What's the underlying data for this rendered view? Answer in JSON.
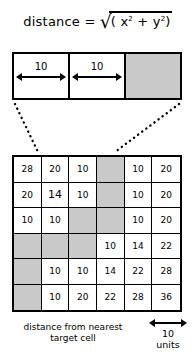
{
  "formula": {
    "label": "distance =",
    "radical_symbol": "√",
    "expression_open": "(",
    "term_x": "x",
    "term_x_exp": "2",
    "operator": "+",
    "term_y": "y",
    "term_y_exp": "2",
    "expression_close": ")",
    "full_text": "distance = √( x² + y² )"
  },
  "top_strip": {
    "cells": [
      {
        "name": "cell-left",
        "fill": "white"
      },
      {
        "name": "cell-middle",
        "fill": "white"
      },
      {
        "name": "cell-target",
        "fill": "gray"
      }
    ],
    "dimensions": [
      {
        "label": "10"
      },
      {
        "label": "10"
      }
    ]
  },
  "grid": {
    "rows": 6,
    "cols": 6,
    "cells": [
      [
        {
          "value": "28",
          "target": false
        },
        {
          "value": "20",
          "target": false
        },
        {
          "value": "10",
          "target": false
        },
        {
          "value": "",
          "target": true
        },
        {
          "value": "10",
          "target": false
        },
        {
          "value": "20",
          "target": false
        }
      ],
      [
        {
          "value": "20",
          "target": false
        },
        {
          "value": "14",
          "target": false
        },
        {
          "value": "10",
          "target": false
        },
        {
          "value": "",
          "target": true
        },
        {
          "value": "10",
          "target": false
        },
        {
          "value": "20",
          "target": false
        }
      ],
      [
        {
          "value": "10",
          "target": false
        },
        {
          "value": "10",
          "target": false
        },
        {
          "value": "",
          "target": true
        },
        {
          "value": "",
          "target": true
        },
        {
          "value": "10",
          "target": false
        },
        {
          "value": "20",
          "target": false
        }
      ],
      [
        {
          "value": "",
          "target": true
        },
        {
          "value": "",
          "target": true
        },
        {
          "value": "",
          "target": true
        },
        {
          "value": "10",
          "target": false
        },
        {
          "value": "14",
          "target": false
        },
        {
          "value": "22",
          "target": false
        }
      ],
      [
        {
          "value": "",
          "target": true
        },
        {
          "value": "10",
          "target": false
        },
        {
          "value": "10",
          "target": false
        },
        {
          "value": "14",
          "target": false
        },
        {
          "value": "22",
          "target": false
        },
        {
          "value": "28",
          "target": false
        }
      ],
      [
        {
          "value": "",
          "target": true
        },
        {
          "value": "10",
          "target": false
        },
        {
          "value": "20",
          "target": false
        },
        {
          "value": "22",
          "target": false
        },
        {
          "value": "28",
          "target": false
        },
        {
          "value": "36",
          "target": false
        }
      ]
    ]
  },
  "caption": {
    "line1": "distance from nearest",
    "line2": "target cell"
  },
  "legend": {
    "value": "10",
    "units": "units"
  },
  "colors": {
    "target_fill": "#c9c9c9",
    "stroke": "#000000",
    "background": "#ffffff"
  }
}
